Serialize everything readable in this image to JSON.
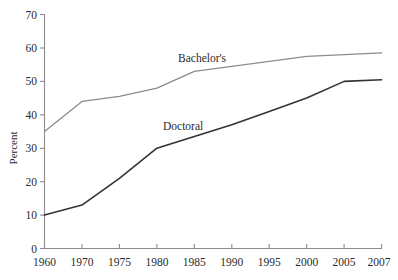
{
  "chart_data": {
    "type": "line",
    "title": "",
    "xlabel": "",
    "ylabel": "Percent",
    "categories": [
      "1960",
      "1970",
      "1975",
      "1980",
      "1985",
      "1990",
      "1995",
      "2000",
      "2005",
      "2007"
    ],
    "x": [
      1960,
      1970,
      1975,
      1980,
      1985,
      1990,
      1995,
      2000,
      2005,
      2007
    ],
    "ylim": [
      0,
      70
    ],
    "yticks": [
      0,
      10,
      20,
      30,
      40,
      50,
      60,
      70
    ],
    "ytick_labels": [
      "0",
      "10",
      "20",
      "30",
      "40",
      "50",
      "60",
      "70"
    ],
    "grid": false,
    "legend_position": "inline-annotations",
    "series": [
      {
        "name": "Bachelor's",
        "color": "#8c8c8c",
        "values": [
          35,
          44,
          45.5,
          48,
          53,
          54.5,
          56,
          57.5,
          58,
          58.5
        ]
      },
      {
        "name": "Doctoral",
        "color": "#333333",
        "values": [
          10,
          13,
          21,
          30,
          33.5,
          37,
          41,
          45,
          50,
          50.5
        ]
      }
    ],
    "annotations": [
      {
        "text": "Bachelor's",
        "x_px": 178,
        "y_px": 62
      },
      {
        "text": "Doctoral",
        "x_px": 163,
        "y_px": 130
      }
    ]
  },
  "axes": {
    "y_axis_title": "Percent",
    "y_tick_labels": [
      "70",
      "60",
      "50",
      "40",
      "30",
      "20",
      "10",
      "0"
    ],
    "x_tick_labels": [
      "1960",
      "1970",
      "1975",
      "1980",
      "1985",
      "1990",
      "1995",
      "2000",
      "2005",
      "2007"
    ]
  },
  "series_labels": {
    "bachelors": "Bachelor's",
    "doctoral": "Doctoral"
  }
}
